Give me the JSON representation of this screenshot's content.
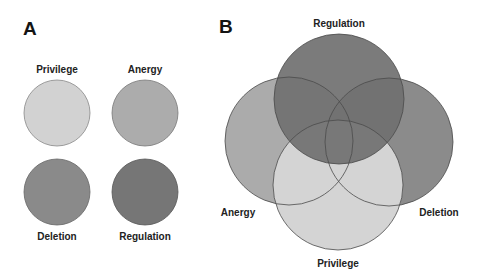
{
  "panel_a": {
    "letter": "A",
    "circles": [
      {
        "label": "Privilege",
        "color": "#d2d2d2"
      },
      {
        "label": "Anergy",
        "color": "#acacac"
      },
      {
        "label": "Deletion",
        "color": "#8a8a8a"
      },
      {
        "label": "Regulation",
        "color": "#767676"
      }
    ]
  },
  "panel_b": {
    "letter": "B",
    "circles": [
      {
        "label": "Regulation",
        "color": "#757575"
      },
      {
        "label": "Anergy",
        "color": "#ababab"
      },
      {
        "label": "Deletion",
        "color": "#8b8b8b"
      },
      {
        "label": "Privilege",
        "color": "#d4d4d4"
      }
    ]
  }
}
